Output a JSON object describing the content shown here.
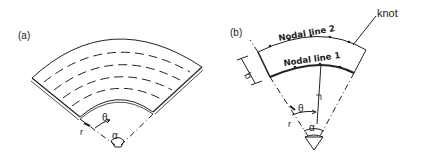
{
  "figure_a": {
    "label": "(a)",
    "theta": "θ",
    "alpha": "α",
    "r": "r"
  },
  "figure_b": {
    "label": "(b)",
    "nodal_line_2": "Nodal line 2",
    "nodal_line_1": "Nodal line 1",
    "knot": "knot",
    "b": "b",
    "theta": "θ",
    "alpha": "α",
    "r": "r",
    "r_local": "r"
  },
  "colors": {
    "stroke": "#222222",
    "background": "#ffffff"
  }
}
